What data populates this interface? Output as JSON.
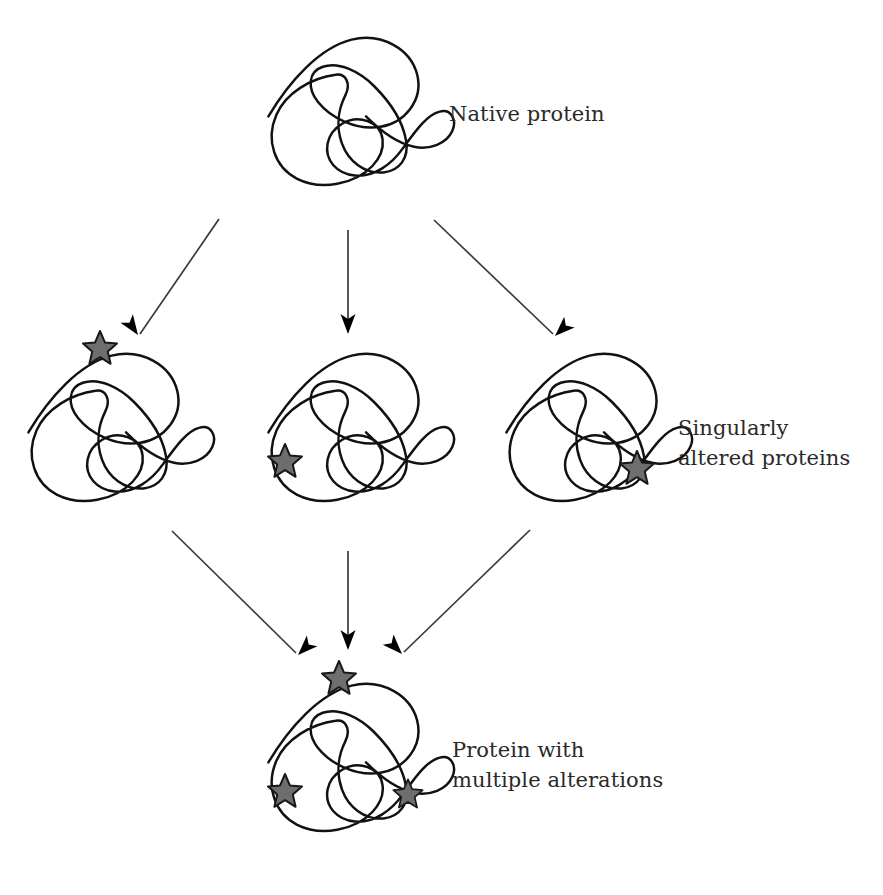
{
  "diagram": {
    "background_color": "#ffffff",
    "chain_color": "#111111",
    "star_fill_color": "#6e6e6e",
    "star_outline_color": "#181818",
    "arrow_color": "#3a3a3a",
    "text_color": "#2a2a2a"
  },
  "labels": {
    "native": "Native protein",
    "singular_line1": "Singularly",
    "singular_line2": "altered proteins",
    "multiple_line1": "Protein with",
    "multiple_line2": "multiple alterations"
  },
  "nodes": [
    {
      "id": "native-protein",
      "name": "Native protein",
      "row": "top",
      "x": 340,
      "y": 125,
      "alteration_count": 0,
      "stars": []
    },
    {
      "id": "altered-protein-left",
      "name": "Singularly altered protein (left)",
      "row": "middle",
      "x": 102,
      "y": 440,
      "alteration_count": 1,
      "stars": [
        {
          "position": "upper-left-tail",
          "x": 100,
          "y": 348
        }
      ]
    },
    {
      "id": "altered-protein-center",
      "name": "Singularly altered protein (center)",
      "row": "middle",
      "x": 348,
      "y": 440,
      "alteration_count": 1,
      "stars": [
        {
          "position": "lower-left-tail",
          "x": 285,
          "y": 461
        }
      ]
    },
    {
      "id": "altered-protein-right",
      "name": "Singularly altered protein (right)",
      "row": "middle",
      "x": 586,
      "y": 440,
      "alteration_count": 1,
      "stars": [
        {
          "position": "right-loop",
          "x": 637,
          "y": 468
        }
      ]
    },
    {
      "id": "multiply-altered-protein",
      "name": "Protein with multiple alterations",
      "row": "bottom",
      "x": 348,
      "y": 760,
      "alteration_count": 3,
      "stars": [
        {
          "position": "upper-left-tail",
          "x": 339,
          "y": 678
        },
        {
          "position": "lower-left-tail",
          "x": 285,
          "y": 791
        },
        {
          "position": "right-loop",
          "x": 408,
          "y": 794
        }
      ]
    }
  ],
  "arrows": [
    {
      "id": "arrow-native-to-left",
      "from": "native-protein",
      "to": "altered-protein-left",
      "x1": 219,
      "y1": 219,
      "x2": 140,
      "y2": 334
    },
    {
      "id": "arrow-native-to-center",
      "from": "native-protein",
      "to": "altered-protein-center",
      "x1": 348,
      "y1": 230,
      "x2": 348,
      "y2": 332
    },
    {
      "id": "arrow-native-to-right",
      "from": "native-protein",
      "to": "altered-protein-right",
      "x1": 434,
      "y1": 220,
      "x2": 553,
      "y2": 334
    },
    {
      "id": "arrow-left-to-bottom",
      "from": "altered-protein-left",
      "to": "multiply-altered-protein",
      "x1": 172,
      "y1": 531,
      "x2": 296,
      "y2": 653
    },
    {
      "id": "arrow-center-to-bottom",
      "from": "altered-protein-center",
      "to": "multiply-altered-protein",
      "x1": 348,
      "y1": 551,
      "x2": 348,
      "y2": 648
    },
    {
      "id": "arrow-right-to-bottom",
      "from": "altered-protein-right",
      "to": "multiply-altered-protein",
      "x1": 530,
      "y1": 530,
      "x2": 404,
      "y2": 652
    }
  ]
}
